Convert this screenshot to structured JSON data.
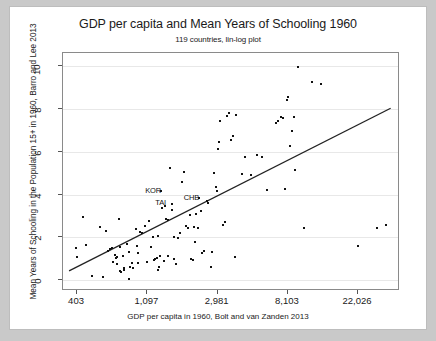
{
  "chart_data": {
    "type": "scatter",
    "title": "GDP per capita and Mean Years of Schooling 1960",
    "subtitle": "119 countries, lin-log plot",
    "xlabel": "GDP per capita in 1960, Bolt and van Zanden 2013",
    "ylabel": "Mean Years of Schooling in the Population 15+ in 1960, Barro and Lee 2013",
    "xscale": "log",
    "yscale": "linear",
    "xticks": [
      "403",
      "1,097",
      "2,981",
      "8,103",
      "22,026"
    ],
    "xtick_values": [
      403,
      1097,
      2981,
      8103,
      22026
    ],
    "yticks": [
      "0",
      "2",
      "4",
      "6",
      "8",
      "10"
    ],
    "ytick_values": [
      0,
      2,
      4,
      6,
      8,
      10
    ],
    "xlim": [
      330,
      40000
    ],
    "ylim": [
      -0.5,
      10.6
    ],
    "grid": "horizontal",
    "legend": "none",
    "n_points": 119,
    "marker_color": "#111111",
    "fitline_color": "#222222",
    "fitline": {
      "x_start": 360,
      "y_start": 0.35,
      "x_end": 36000,
      "y_end": 8.0
    },
    "annotations": [
      {
        "label": "KOR",
        "x": 1300,
        "y": 4.15
      },
      {
        "label": "TAI",
        "x": 1500,
        "y": 3.6
      },
      {
        "label": "CHB",
        "x": 2250,
        "y": 3.85
      }
    ],
    "points": [
      {
        "x": 398,
        "y": 1.5
      },
      {
        "x": 400,
        "y": 1.1
      },
      {
        "x": 440,
        "y": 2.95
      },
      {
        "x": 455,
        "y": 1.65
      },
      {
        "x": 500,
        "y": 0.2
      },
      {
        "x": 560,
        "y": 2.5
      },
      {
        "x": 580,
        "y": 0.15
      },
      {
        "x": 610,
        "y": 2.3
      },
      {
        "x": 625,
        "y": 1.35
      },
      {
        "x": 640,
        "y": 1.45
      },
      {
        "x": 660,
        "y": 1.5
      },
      {
        "x": 670,
        "y": 0.85
      },
      {
        "x": 690,
        "y": 1.2
      },
      {
        "x": 700,
        "y": 1.05
      },
      {
        "x": 710,
        "y": 1.1
      },
      {
        "x": 715,
        "y": 0.75
      },
      {
        "x": 730,
        "y": 2.85
      },
      {
        "x": 740,
        "y": 1.55
      },
      {
        "x": 745,
        "y": 0.45
      },
      {
        "x": 755,
        "y": 0.4
      },
      {
        "x": 770,
        "y": 1.15
      },
      {
        "x": 790,
        "y": 0.55
      },
      {
        "x": 820,
        "y": 1.7
      },
      {
        "x": 840,
        "y": 0.05
      },
      {
        "x": 860,
        "y": 0.6
      },
      {
        "x": 880,
        "y": 0.8
      },
      {
        "x": 900,
        "y": 0.55
      },
      {
        "x": 930,
        "y": 2.4
      },
      {
        "x": 940,
        "y": 1.6
      },
      {
        "x": 960,
        "y": 0.8
      },
      {
        "x": 990,
        "y": 2.25
      },
      {
        "x": 1010,
        "y": 2.2
      },
      {
        "x": 1060,
        "y": 2.55
      },
      {
        "x": 1090,
        "y": 0.85
      },
      {
        "x": 1120,
        "y": 2.75
      },
      {
        "x": 1180,
        "y": 2.0
      },
      {
        "x": 1200,
        "y": 0.95
      },
      {
        "x": 1230,
        "y": 1.0
      },
      {
        "x": 1250,
        "y": 1.05
      },
      {
        "x": 1280,
        "y": 2.05
      },
      {
        "x": 1300,
        "y": 0.6
      },
      {
        "x": 1320,
        "y": 1.15
      },
      {
        "x": 1360,
        "y": 3.35
      },
      {
        "x": 1400,
        "y": 3.45
      },
      {
        "x": 1430,
        "y": 2.85
      },
      {
        "x": 1470,
        "y": 1.15
      },
      {
        "x": 1520,
        "y": 5.25
      },
      {
        "x": 1560,
        "y": 3.3
      },
      {
        "x": 1600,
        "y": 2.0
      },
      {
        "x": 1650,
        "y": 0.75
      },
      {
        "x": 1700,
        "y": 1.95
      },
      {
        "x": 1750,
        "y": 2.2
      },
      {
        "x": 1800,
        "y": 4.6
      },
      {
        "x": 1850,
        "y": 5.05
      },
      {
        "x": 1900,
        "y": 2.55
      },
      {
        "x": 1950,
        "y": 2.45
      },
      {
        "x": 2000,
        "y": 3.05
      },
      {
        "x": 2050,
        "y": 1.0
      },
      {
        "x": 2100,
        "y": 0.95
      },
      {
        "x": 2150,
        "y": 1.8
      },
      {
        "x": 2200,
        "y": 3.1
      },
      {
        "x": 2250,
        "y": 2.45
      },
      {
        "x": 2350,
        "y": 3.25
      },
      {
        "x": 2450,
        "y": 1.35
      },
      {
        "x": 2550,
        "y": 3.7
      },
      {
        "x": 2600,
        "y": 3.6
      },
      {
        "x": 2700,
        "y": 0.6
      },
      {
        "x": 2750,
        "y": 1.3
      },
      {
        "x": 2850,
        "y": 5.0
      },
      {
        "x": 2900,
        "y": 4.35
      },
      {
        "x": 2950,
        "y": 4.15
      },
      {
        "x": 3000,
        "y": 6.1
      },
      {
        "x": 3050,
        "y": 6.45
      },
      {
        "x": 3100,
        "y": 7.45
      },
      {
        "x": 3200,
        "y": 2.6
      },
      {
        "x": 3300,
        "y": 2.7
      },
      {
        "x": 3400,
        "y": 7.65
      },
      {
        "x": 3500,
        "y": 7.8
      },
      {
        "x": 3600,
        "y": 6.55
      },
      {
        "x": 3700,
        "y": 6.75
      },
      {
        "x": 3800,
        "y": 1.1
      },
      {
        "x": 3900,
        "y": 7.7
      },
      {
        "x": 4200,
        "y": 4.95
      },
      {
        "x": 4400,
        "y": 5.75
      },
      {
        "x": 4800,
        "y": 4.9
      },
      {
        "x": 5200,
        "y": 5.85
      },
      {
        "x": 5600,
        "y": 5.75
      },
      {
        "x": 6000,
        "y": 4.2
      },
      {
        "x": 6800,
        "y": 7.35
      },
      {
        "x": 7000,
        "y": 7.45
      },
      {
        "x": 7400,
        "y": 7.6
      },
      {
        "x": 7600,
        "y": 7.55
      },
      {
        "x": 7800,
        "y": 4.25
      },
      {
        "x": 8000,
        "y": 8.4
      },
      {
        "x": 8100,
        "y": 8.55
      },
      {
        "x": 8300,
        "y": 6.25
      },
      {
        "x": 8600,
        "y": 6.95
      },
      {
        "x": 8900,
        "y": 7.6
      },
      {
        "x": 9000,
        "y": 5.15
      },
      {
        "x": 9300,
        "y": 9.95
      },
      {
        "x": 10200,
        "y": 2.45
      },
      {
        "x": 11500,
        "y": 9.25
      },
      {
        "x": 13000,
        "y": 9.15
      },
      {
        "x": 22000,
        "y": 1.6
      },
      {
        "x": 29000,
        "y": 2.45
      },
      {
        "x": 33000,
        "y": 2.6
      },
      {
        "x": 1340,
        "y": 4.15
      },
      {
        "x": 1560,
        "y": 3.55
      },
      {
        "x": 2300,
        "y": 3.85
      },
      {
        "x": 1480,
        "y": 2.8
      },
      {
        "x": 1150,
        "y": 1.55
      },
      {
        "x": 960,
        "y": 1.25
      },
      {
        "x": 840,
        "y": 1.3
      },
      {
        "x": 790,
        "y": 0.5
      },
      {
        "x": 1280,
        "y": 0.5
      },
      {
        "x": 1380,
        "y": 0.9
      },
      {
        "x": 1600,
        "y": 1.0
      },
      {
        "x": 2120,
        "y": 2.5
      },
      {
        "x": 2380,
        "y": 1.25
      }
    ]
  }
}
